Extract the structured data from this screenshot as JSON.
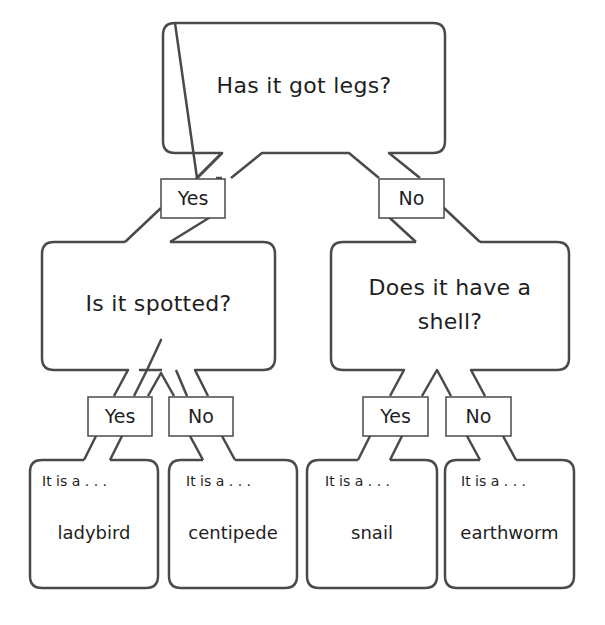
{
  "root": {
    "question": "Has it got legs?",
    "yes_label": "Yes",
    "no_label": "No"
  },
  "left_branch": {
    "question": "Is it spotted?",
    "yes_label": "Yes",
    "no_label": "No",
    "yes_leaf": {
      "intro": "It is a . . .",
      "answer": "ladybird"
    },
    "no_leaf": {
      "intro": "It is a . . .",
      "answer": "centipede"
    }
  },
  "right_branch": {
    "question_line1": "Does it have a",
    "question_line2": "shell?",
    "yes_label": "Yes",
    "no_label": "No",
    "yes_leaf": {
      "intro": "It is a . . .",
      "answer": "snail"
    },
    "no_leaf": {
      "intro": "It is a . . .",
      "answer": "earthworm"
    }
  },
  "colors": {
    "stroke": "#4a4a4a",
    "text": "#1e1e1e",
    "background": "#ffffff"
  }
}
